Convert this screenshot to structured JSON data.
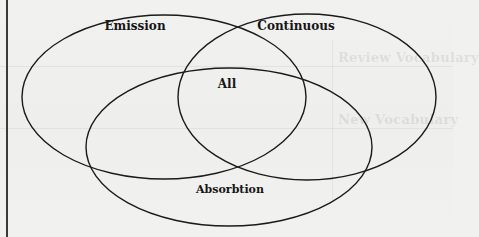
{
  "diagram": {
    "type": "venn",
    "sets": [
      {
        "id": "emission",
        "label": "Emission"
      },
      {
        "id": "continuous",
        "label": "Continuous"
      },
      {
        "id": "absorbtion",
        "label": "Absorbtion"
      }
    ],
    "intersection_label": "All",
    "stroke_color": "#1a1a1a",
    "background_color": "#f1f1ef"
  },
  "show_through": {
    "items": [
      "Review Vocabulary",
      "New Vocabulary"
    ]
  }
}
